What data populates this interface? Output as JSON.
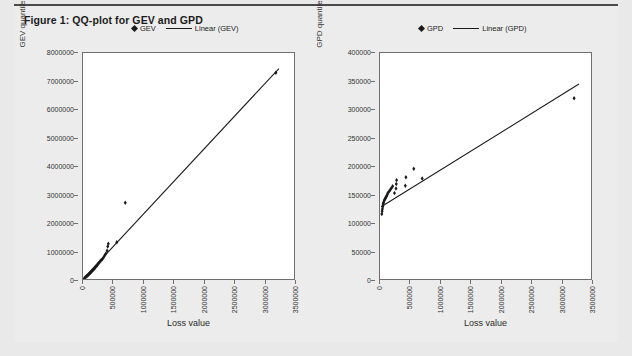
{
  "figure": {
    "title": "Figure 1: QQ-plot for GEV and GPD",
    "background": "#ececec",
    "accent": "#1a1a1a"
  },
  "chart_data": [
    {
      "id": "gev",
      "type": "scatter",
      "title": "",
      "xlabel": "Loss value",
      "ylabel": "GEV quantile",
      "xlim": [
        0,
        3500000
      ],
      "ylim": [
        0,
        8000000
      ],
      "grid": false,
      "legend_position": "top-left-inside",
      "xticks": [
        0,
        500000,
        1000000,
        1500000,
        2000000,
        2500000,
        3000000,
        3500000
      ],
      "xticklabels": [
        "0",
        "500000",
        "1000000",
        "1500000",
        "2000000",
        "2500000",
        "3000000",
        "3500000"
      ],
      "yticks": [
        0,
        1000000,
        2000000,
        3000000,
        4000000,
        5000000,
        6000000,
        7000000,
        8000000
      ],
      "yticklabels": [
        "0",
        "1000000",
        "2000000",
        "3000000",
        "4000000",
        "5000000",
        "6000000",
        "7000000",
        "8000000"
      ],
      "series": [
        {
          "name": "GEV",
          "kind": "scatter",
          "marker": "diamond",
          "color": "#1a1a1a",
          "points": [
            [
              30000,
              40000
            ],
            [
              45000,
              70000
            ],
            [
              60000,
              95000
            ],
            [
              75000,
              120000
            ],
            [
              90000,
              150000
            ],
            [
              100000,
              175000
            ],
            [
              115000,
              200000
            ],
            [
              125000,
              230000
            ],
            [
              140000,
              260000
            ],
            [
              155000,
              300000
            ],
            [
              170000,
              330000
            ],
            [
              185000,
              360000
            ],
            [
              200000,
              400000
            ],
            [
              215000,
              440000
            ],
            [
              230000,
              470000
            ],
            [
              245000,
              520000
            ],
            [
              260000,
              560000
            ],
            [
              280000,
              610000
            ],
            [
              300000,
              660000
            ],
            [
              320000,
              700000
            ],
            [
              340000,
              760000
            ],
            [
              360000,
              830000
            ],
            [
              380000,
              900000
            ],
            [
              400000,
              1000000
            ],
            [
              410000,
              1150000
            ],
            [
              420000,
              1250000
            ],
            [
              560000,
              1300000
            ],
            [
              700000,
              2700000
            ],
            [
              3200000,
              7300000
            ]
          ]
        },
        {
          "name": "Linear (GEV)",
          "kind": "line",
          "color": "#1a1a1a",
          "line": [
            [
              0,
              0
            ],
            [
              3250000,
              7450000
            ]
          ]
        }
      ]
    },
    {
      "id": "gpd",
      "type": "scatter",
      "title": "",
      "xlabel": "Loss value",
      "ylabel": "GPD quantile",
      "xlim": [
        0,
        3500000
      ],
      "ylim": [
        0,
        400000
      ],
      "grid": false,
      "legend_position": "top-left-inside",
      "xticks": [
        0,
        500000,
        1000000,
        1500000,
        2000000,
        2500000,
        3000000,
        3500000
      ],
      "xticklabels": [
        "0",
        "500000",
        "1000000",
        "1500000",
        "2000000",
        "2500000",
        "3000000",
        "3500000"
      ],
      "yticks": [
        0,
        50000,
        100000,
        150000,
        200000,
        250000,
        300000,
        350000,
        400000
      ],
      "yticklabels": [
        "0",
        "50000",
        "100000",
        "150000",
        "200000",
        "250000",
        "300000",
        "350000",
        "400000"
      ],
      "series": [
        {
          "name": "GPD",
          "kind": "scatter",
          "marker": "diamond",
          "color": "#1a1a1a",
          "points": [
            [
              30000,
              115000
            ],
            [
              35000,
              120000
            ],
            [
              40000,
              124000
            ],
            [
              45000,
              128000
            ],
            [
              50000,
              131000
            ],
            [
              55000,
              134000
            ],
            [
              60000,
              136000
            ],
            [
              70000,
              139000
            ],
            [
              80000,
              141000
            ],
            [
              90000,
              143000
            ],
            [
              100000,
              145000
            ],
            [
              110000,
              147000
            ],
            [
              120000,
              149000
            ],
            [
              130000,
              152000
            ],
            [
              150000,
              155000
            ],
            [
              170000,
              158000
            ],
            [
              190000,
              161000
            ],
            [
              210000,
              164000
            ],
            [
              240000,
              152000
            ],
            [
              265000,
              160000
            ],
            [
              270000,
              168000
            ],
            [
              275000,
              175000
            ],
            [
              420000,
              165000
            ],
            [
              430000,
              180000
            ],
            [
              560000,
              195000
            ],
            [
              700000,
              178000
            ],
            [
              3220000,
              320000
            ]
          ]
        },
        {
          "name": "Linear (GPD)",
          "kind": "line",
          "color": "#1a1a1a",
          "line": [
            [
              20000,
              128000
            ],
            [
              3300000,
              345000
            ]
          ]
        }
      ]
    }
  ],
  "charts": {
    "gev": {
      "legend": {
        "marker_label": "GEV",
        "line_label": "Linear (GEV)"
      },
      "ylabel": "GEV quantile",
      "xlabel": "Loss value"
    },
    "gpd": {
      "legend": {
        "marker_label": "GPD",
        "line_label": "Linear (GPD)"
      },
      "ylabel": "GPD quantile",
      "xlabel": "Loss value"
    }
  }
}
